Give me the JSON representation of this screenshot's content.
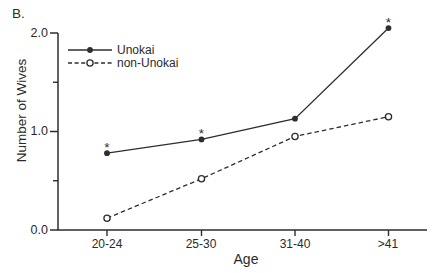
{
  "figure": {
    "panel_label": "B.",
    "background": "#ffffff",
    "ink_color": "#2e2e2e"
  },
  "chart_data": {
    "type": "line",
    "title": "",
    "xlabel": "Age",
    "ylabel": "Number of Wives",
    "categories": [
      "20-24",
      "25-30",
      "31-40",
      ">41"
    ],
    "series": [
      {
        "name": "Unokai",
        "line_style": "solid",
        "marker": "filled-circle",
        "values": [
          0.78,
          0.92,
          1.13,
          2.05
        ],
        "annotations": [
          "*",
          "*",
          "",
          "*"
        ]
      },
      {
        "name": "non-Unokai",
        "line_style": "dashed",
        "marker": "open-circle",
        "values": [
          0.12,
          0.52,
          0.95,
          1.15
        ],
        "annotations": [
          "",
          "",
          "",
          ""
        ]
      }
    ],
    "ylim": [
      0.0,
      2.0
    ],
    "yticks_major": [
      0.0,
      1.0,
      2.0
    ],
    "ytick_labels": [
      "0.0",
      "1.0",
      "2.0"
    ],
    "yticks_minor": [
      0.5,
      1.5
    ],
    "legend_position": "top-left",
    "grid": false
  }
}
